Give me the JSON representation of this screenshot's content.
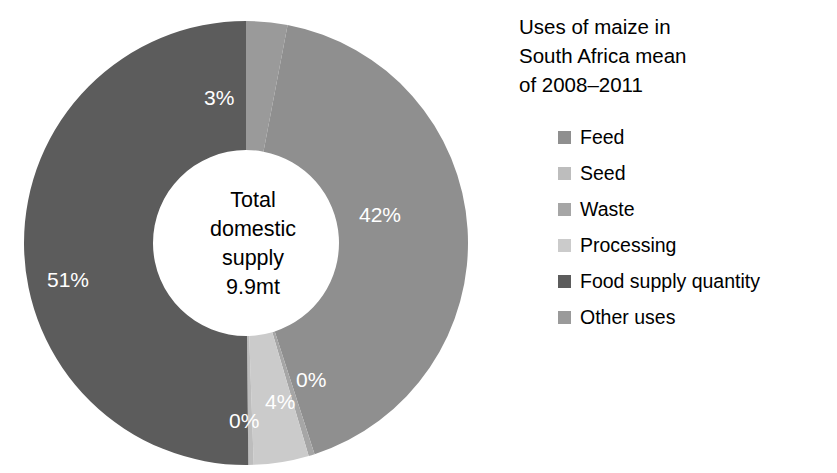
{
  "chart_data": {
    "type": "pie",
    "variant": "donut",
    "title": "Uses of maize in South Africa mean of 2008–2011",
    "title_lines": [
      "Uses of maize in",
      "South Africa mean",
      "of 2008–2011"
    ],
    "center_text_lines": [
      "Total",
      "domestic",
      "supply",
      "9.9mt"
    ],
    "center_total": "9.9mt",
    "categories": [
      "Feed",
      "Seed",
      "Waste",
      "Processing",
      "Food supply quantity",
      "Other uses"
    ],
    "values": [
      42,
      0,
      0,
      4,
      51,
      3
    ],
    "labels": [
      "42%",
      "0%",
      "0%",
      "4%",
      "51%",
      "3%"
    ],
    "colors": [
      "#8f8f8f",
      "#bdbdbd",
      "#a6a6a6",
      "#cbcbcb",
      "#5c5c5c",
      "#9a9a9a"
    ],
    "draw_order": [
      {
        "name": "Other uses",
        "label": "3%",
        "value": 3,
        "start_deg": 0,
        "end_deg": 10.8,
        "color": "#9a9a9a"
      },
      {
        "name": "Feed",
        "label": "42%",
        "value": 42,
        "start_deg": 10.8,
        "end_deg": 162.0,
        "color": "#8f8f8f"
      },
      {
        "name": "Waste",
        "label": "0%",
        "value": 0,
        "start_deg": 162.0,
        "end_deg": 163.6,
        "color": "#a6a6a6"
      },
      {
        "name": "Processing",
        "label": "4%",
        "value": 4,
        "start_deg": 163.6,
        "end_deg": 178.0,
        "color": "#cbcbcb"
      },
      {
        "name": "Seed",
        "label": "0%",
        "value": 0,
        "start_deg": 178.0,
        "end_deg": 179.4,
        "color": "#bdbdbd"
      },
      {
        "name": "Food supply quantity",
        "label": "51%",
        "value": 51,
        "start_deg": 179.4,
        "end_deg": 360.0,
        "color": "#5c5c5c"
      }
    ],
    "legend": [
      {
        "label": "Feed",
        "color": "#8f8f8f"
      },
      {
        "label": "Seed",
        "color": "#bdbdbd"
      },
      {
        "label": "Waste",
        "color": "#a6a6a6"
      },
      {
        "label": "Processing",
        "color": "#cbcbcb"
      },
      {
        "label": "Food supply quantity",
        "color": "#5c5c5c"
      },
      {
        "label": "Other uses",
        "color": "#9a9a9a"
      }
    ],
    "legend_position": "right",
    "data_label_color": "#ffffff",
    "background": "#ffffff",
    "units": "percent of total domestic supply",
    "total": "9.9mt"
  }
}
